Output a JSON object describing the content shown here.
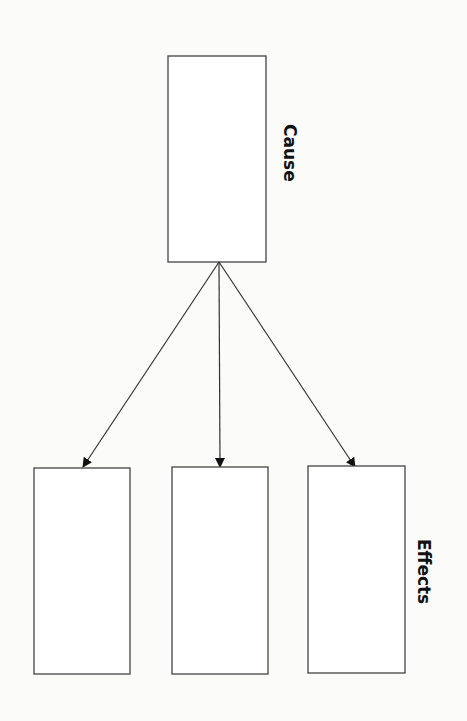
{
  "diagram": {
    "type": "cause-effect",
    "cause": {
      "label": "Cause",
      "box": {
        "x": 168,
        "y": 56,
        "w": 98,
        "h": 206
      }
    },
    "effects": {
      "label": "Effects",
      "boxes": [
        {
          "x": 34,
          "y": 468,
          "w": 96,
          "h": 206
        },
        {
          "x": 172,
          "y": 467,
          "w": 96,
          "h": 207
        },
        {
          "x": 308,
          "y": 466,
          "w": 97,
          "h": 207
        }
      ]
    },
    "arrows": [
      {
        "from": [
          219,
          262
        ],
        "to": [
          83,
          467
        ]
      },
      {
        "from": [
          219,
          262
        ],
        "to": [
          220,
          467
        ]
      },
      {
        "from": [
          219,
          262
        ],
        "to": [
          355,
          467
        ]
      }
    ],
    "colors": {
      "stroke": "#444444",
      "arrowhead": "#111111",
      "background": "#fbfbfa"
    }
  }
}
